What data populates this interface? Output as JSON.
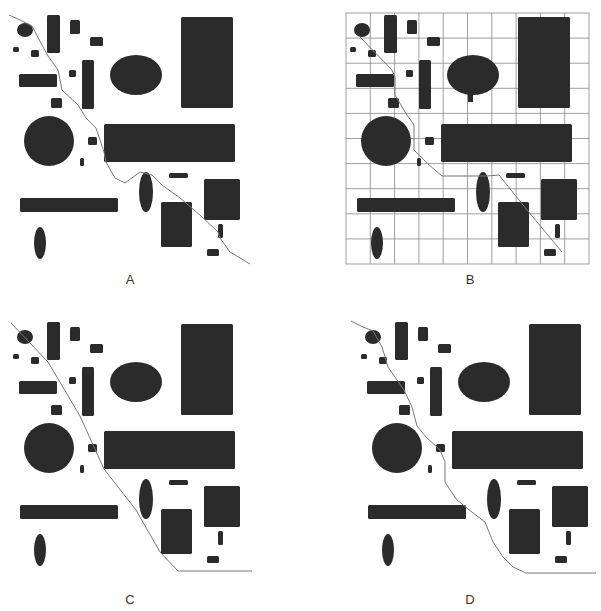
{
  "figure": {
    "colors": {
      "obstacle": "#2b2b2b",
      "path": "#777777",
      "grid": "#888888",
      "background": "#ffffff"
    },
    "panels": [
      {
        "id": "A",
        "label": "A",
        "dx": 0,
        "dy": 0,
        "grid": false,
        "path": "M9,15 L20,20 L32,26 L42,45 L48,56 L58,70 L62,90 L78,105 L86,118 L96,128 L104,152 L106,162 L115,178 L125,183 L140,172 L152,175 L162,185 L180,198 L200,215 L218,232 L220,238 L230,252 L250,264"
      },
      {
        "id": "B",
        "label": "B",
        "dx": 337,
        "dy": 0,
        "grid": true,
        "path": "M22,36 L55,70 L58,77 L58,95 L68,112 L77,125 L77,150 L92,165 L105,176 L150,176 L162,175 L190,210 L215,240 L225,252"
      },
      {
        "id": "C",
        "label": "C",
        "dx": 0,
        "dy": 307,
        "grid": false,
        "path": "M11,16 L48,55 L80,109 L104,162 L136,203 L160,245 L178,264 L252,264"
      },
      {
        "id": "D",
        "label": "D",
        "dx": 348,
        "dy": 307,
        "grid": false,
        "path": "M3,14 L15,20 L25,24 L34,40 L40,60 L56,83 L64,100 L69,119 L78,130 L92,143 L97,155 L97,175 L108,192 L120,202 L137,215 L145,235 L155,250 L165,260 L178,266 L248,266"
      }
    ],
    "obstacles": [
      {
        "type": "ellipse",
        "cx": 25,
        "cy": 30,
        "rx": 8,
        "ry": 7
      },
      {
        "type": "rect",
        "x": 47,
        "y": 15,
        "w": 13,
        "h": 38
      },
      {
        "type": "rect",
        "x": 70,
        "y": 20,
        "w": 10,
        "h": 14
      },
      {
        "type": "rect",
        "x": 90,
        "y": 37,
        "w": 13,
        "h": 9
      },
      {
        "type": "rect",
        "x": 13,
        "y": 47,
        "w": 6,
        "h": 5
      },
      {
        "type": "rect",
        "x": 31,
        "y": 50,
        "w": 8,
        "h": 7
      },
      {
        "type": "rect",
        "x": 19,
        "y": 74,
        "w": 38,
        "h": 13
      },
      {
        "type": "rect",
        "x": 69,
        "y": 70,
        "w": 7,
        "h": 7
      },
      {
        "type": "rect",
        "x": 82,
        "y": 60,
        "w": 12,
        "h": 49
      },
      {
        "type": "ellipse",
        "cx": 136,
        "cy": 75,
        "rx": 26,
        "ry": 20
      },
      {
        "type": "rect",
        "x": 181,
        "y": 17,
        "w": 52,
        "h": 91
      },
      {
        "type": "rect",
        "x": 51,
        "y": 98,
        "w": 11,
        "h": 10
      },
      {
        "type": "ellipse",
        "cx": 49,
        "cy": 141,
        "rx": 25,
        "ry": 25
      },
      {
        "type": "rect",
        "x": 88,
        "y": 137,
        "w": 9,
        "h": 8
      },
      {
        "type": "rect",
        "x": 104,
        "y": 124,
        "w": 131,
        "h": 38
      },
      {
        "type": "rect",
        "x": 80,
        "y": 158,
        "w": 4,
        "h": 8
      },
      {
        "type": "rect",
        "x": 169,
        "y": 173,
        "w": 19,
        "h": 5
      },
      {
        "type": "ellipse",
        "cx": 146,
        "cy": 192,
        "rx": 7,
        "ry": 20
      },
      {
        "type": "rect",
        "x": 204,
        "y": 179,
        "w": 36,
        "h": 41
      },
      {
        "type": "rect",
        "x": 20,
        "y": 198,
        "w": 98,
        "h": 14
      },
      {
        "type": "rect",
        "x": 161,
        "y": 202,
        "w": 31,
        "h": 45
      },
      {
        "type": "rect",
        "x": 218,
        "y": 224,
        "w": 5,
        "h": 14
      },
      {
        "type": "rect",
        "x": 207,
        "y": 249,
        "w": 12,
        "h": 7
      },
      {
        "type": "ellipse",
        "cx": 40,
        "cy": 243,
        "rx": 6,
        "ry": 16
      }
    ],
    "grid_box": {
      "x": 9,
      "y": 13,
      "w": 243,
      "h": 251,
      "cols": 10,
      "rows": 10
    },
    "label_pos": {
      "x": 130,
      "y": 284
    }
  }
}
